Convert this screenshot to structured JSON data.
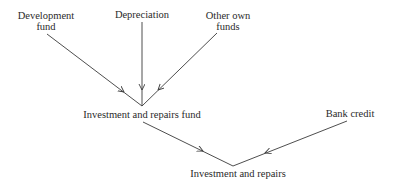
{
  "diagram": {
    "type": "flow",
    "nodes": {
      "development_fund": {
        "line1": "Development",
        "line2": "fund"
      },
      "depreciation": {
        "label": "Depreciation"
      },
      "other_own_funds": {
        "line1": "Other own",
        "line2": "funds"
      },
      "investment_repairs_fund": {
        "label": "Investment and repairs fund"
      },
      "bank_credit": {
        "label": "Bank credit"
      },
      "investment_repairs": {
        "label": "Investment and repairs"
      }
    },
    "edges": [
      {
        "from": "Development fund",
        "to": "Investment and repairs fund"
      },
      {
        "from": "Depreciation",
        "to": "Investment and repairs fund"
      },
      {
        "from": "Other own funds",
        "to": "Investment and repairs fund"
      },
      {
        "from": "Investment and repairs fund",
        "to": "Investment and repairs"
      },
      {
        "from": "Bank credit",
        "to": "Investment and repairs"
      }
    ],
    "colors": {
      "line": "#3a3a3a",
      "text": "#2a2a2a",
      "background": "#ffffff"
    }
  }
}
